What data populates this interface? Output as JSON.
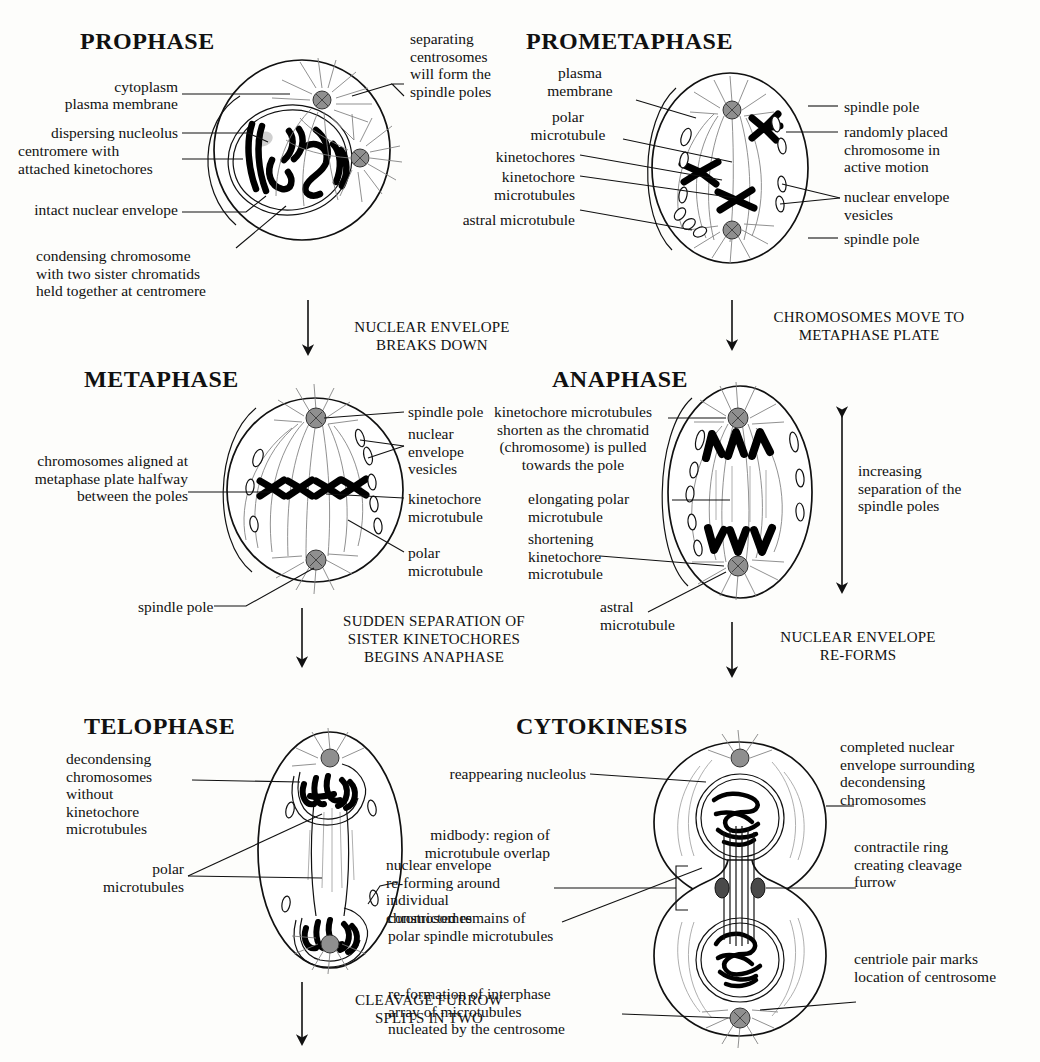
{
  "diagram": {
    "stages": [
      {
        "id": "prophase",
        "name": "PROPHASE",
        "labels": [
          "cytoplasm",
          "plasma membrane",
          "dispersing nucleolus",
          "centromere with\nattached kinetochores",
          "intact nuclear envelope",
          "condensing chromosome\nwith two sister chromatids\nheld together at centromere",
          "separating\ncentrosomes\nwill form the\nspindle poles"
        ]
      },
      {
        "id": "prometaphase",
        "name": "PROMETAPHASE",
        "labels": [
          "plasma\nmembrane",
          "polar\nmicrotubule",
          "kinetochores",
          "kinetochore\nmicrotubules",
          "astral microtubule",
          "spindle pole",
          "randomly placed\nchromosome in\nactive motion",
          "nuclear envelope\nvesicles",
          "spindle pole"
        ]
      },
      {
        "id": "metaphase",
        "name": "METAPHASE",
        "labels": [
          "chromosomes aligned at\nmetaphase plate halfway\nbetween the poles",
          "spindle pole",
          "spindle pole",
          "nuclear\nenvelope\nvesicles",
          "kinetochore\nmicrotubule",
          "polar\nmicrotubule"
        ]
      },
      {
        "id": "anaphase",
        "name": "ANAPHASE",
        "labels": [
          "kinetochore microtubules\nshorten as the chromatid\n(chromosome) is pulled\ntowards the pole",
          "elongating polar\nmicrotubule",
          "shortening\nkinetochore\nmicrotubule",
          "astral\nmicrotubule",
          "increasing\nseparation of the\nspindle poles"
        ]
      },
      {
        "id": "telophase",
        "name": "TELOPHASE",
        "labels": [
          "decondensing\nchromosomes\nwithout\nkinetochore\nmicrotubules",
          "polar\nmicrotubules",
          "nuclear envelope\nre-forming around\nindividual\nchromosomes"
        ]
      },
      {
        "id": "cytokinesis",
        "name": "CYTOKINESIS",
        "labels": [
          "reappearing nucleolus",
          "midbody: region of\nmicrotubule overlap",
          "constricted remains of\npolar spindle microtubules",
          "re-formation of interphase\narray of microtubules\nnucleated by the centrosome",
          "completed nuclear\nenvelope surrounding\ndecondensing\nchromosomes",
          "contractile ring\ncreating cleavage\nfurrow",
          "centriole pair marks\nlocation of centrosome"
        ]
      }
    ],
    "transitions": [
      {
        "id": "t1",
        "text": "NUCLEAR ENVELOPE\nBREAKS DOWN"
      },
      {
        "id": "t2",
        "text": "CHROMOSOMES MOVE TO\nMETAPHASE PLATE"
      },
      {
        "id": "t3",
        "text": "SUDDEN SEPARATION OF\nSISTER KINETOCHORES\nBEGINS ANAPHASE"
      },
      {
        "id": "t4",
        "text": "NUCLEAR ENVELOPE\nRE-FORMS"
      },
      {
        "id": "t5",
        "text": "CLEAVAGE FURROW\nSPLITS IN TWO"
      }
    ],
    "colors": {
      "ink": "#111111",
      "microtubule": "#7d7d7d",
      "centrosome": "#8f8f8f",
      "background": "#fdfdfb"
    },
    "prophase_titles": {
      "title": "PROPHASE"
    },
    "prometaphase_titles": {
      "title": "PROMETAPHASE"
    },
    "metaphase_titles": {
      "title": "METAPHASE"
    },
    "anaphase_titles": {
      "title": "ANAPHASE"
    },
    "telophase_titles": {
      "title": "TELOPHASE"
    },
    "cytokinesis_titles": {
      "title": "CYTOKINESIS"
    }
  }
}
